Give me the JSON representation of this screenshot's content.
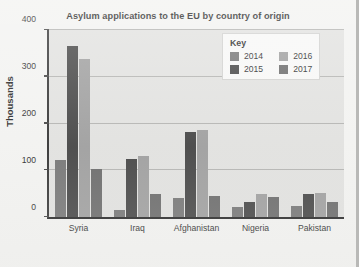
{
  "chart_data": {
    "type": "bar",
    "title": "Asylum applications to the EU by country of origin",
    "xlabel": "",
    "ylabel": "Thousands",
    "ylim": [
      0,
      400
    ],
    "yticks": [
      0,
      100,
      200,
      300,
      400
    ],
    "ytick_labels": [
      "0",
      "100",
      "200",
      "300",
      "400"
    ],
    "grid": true,
    "legend_position": "upper-right-inside",
    "legend_title": "Key",
    "categories": [
      "Syria",
      "Iraq",
      "Afghanistan",
      "Nigeria",
      "Pakistan"
    ],
    "series": [
      {
        "name": "2014",
        "color": "#6f6f6f",
        "values": [
          122,
          15,
          41,
          22,
          24
        ]
      },
      {
        "name": "2015",
        "color": "#3c3c3c",
        "values": [
          365,
          125,
          182,
          33,
          50
        ]
      },
      {
        "name": "2016",
        "color": "#9a9a9a",
        "values": [
          337,
          130,
          187,
          50,
          52
        ]
      },
      {
        "name": "2017",
        "color": "#636363",
        "values": [
          103,
          50,
          46,
          43,
          32
        ]
      }
    ]
  },
  "colors": {
    "plot_background": "#e0e0de",
    "page_background": "#f2f2f0",
    "axis": "#1c1c1c",
    "gridline": "#b0b0ae"
  }
}
